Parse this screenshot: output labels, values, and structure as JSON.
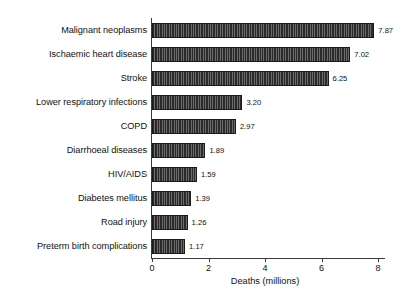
{
  "chart_data": {
    "type": "bar",
    "orientation": "horizontal",
    "title": "",
    "xlabel": "Deaths (millions)",
    "ylabel": "",
    "xlim": [
      0,
      8.5
    ],
    "xticks": [
      "0",
      "2",
      "4",
      "6",
      "8"
    ],
    "xtick_values": [
      0,
      2,
      4,
      6,
      8
    ],
    "grid": false,
    "legend": null,
    "bar_color": "#2b2b2b",
    "categories": [
      "Malignant neoplasms",
      "Ischaemic heart disease",
      "Stroke",
      "Lower respiratory infections",
      "COPD",
      "Diarrhoeal diseases",
      "HIV/AIDS",
      "Diabetes mellitus",
      "Road injury",
      "Preterm birth complications"
    ],
    "values": [
      7.87,
      7.02,
      6.25,
      3.2,
      2.97,
      1.89,
      1.59,
      1.39,
      1.26,
      1.17
    ],
    "value_labels": [
      "7.87",
      "7.02",
      "6.25",
      "3.20",
      "2.97",
      "1.89",
      "1.59",
      "1.39",
      "1.26",
      "1.17"
    ]
  }
}
